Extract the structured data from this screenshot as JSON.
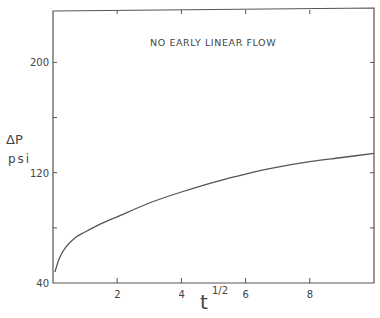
{
  "chart_data": {
    "type": "line",
    "title": "",
    "annotation": "NO EARLY LINEAR FLOW",
    "xlabel": "t",
    "xlabel_superscript": "1/2",
    "ylabel": "ΔP",
    "ylabel_units": "psi",
    "xlim": [
      0,
      10
    ],
    "ylim": [
      40,
      238
    ],
    "x_ticks": [
      2,
      4,
      6,
      8
    ],
    "x_tick_labels": [
      "2",
      "4",
      "6",
      "8"
    ],
    "y_ticks": [
      40,
      80,
      120,
      160,
      200
    ],
    "y_tick_labels": [
      "40",
      "",
      "120",
      "",
      "200"
    ],
    "grid": false,
    "legend": null,
    "series": [
      {
        "name": "Delta P vs sqrt(t)",
        "x": [
          0.06,
          0.2,
          0.4,
          0.7,
          1.0,
          1.5,
          2.0,
          3.0,
          4.0,
          5.0,
          6.0,
          7.0,
          8.0,
          9.0,
          10.0
        ],
        "y": [
          48,
          58,
          66,
          73,
          77,
          83,
          88,
          98,
          106,
          113,
          119,
          124,
          128,
          131,
          134
        ]
      }
    ]
  },
  "labels": {
    "annotation": "NO EARLY LINEAR FLOW",
    "xlabel": "t",
    "xlabel_sup": "1/2",
    "ylabel": "ΔP",
    "ylabel_units": "psi"
  }
}
